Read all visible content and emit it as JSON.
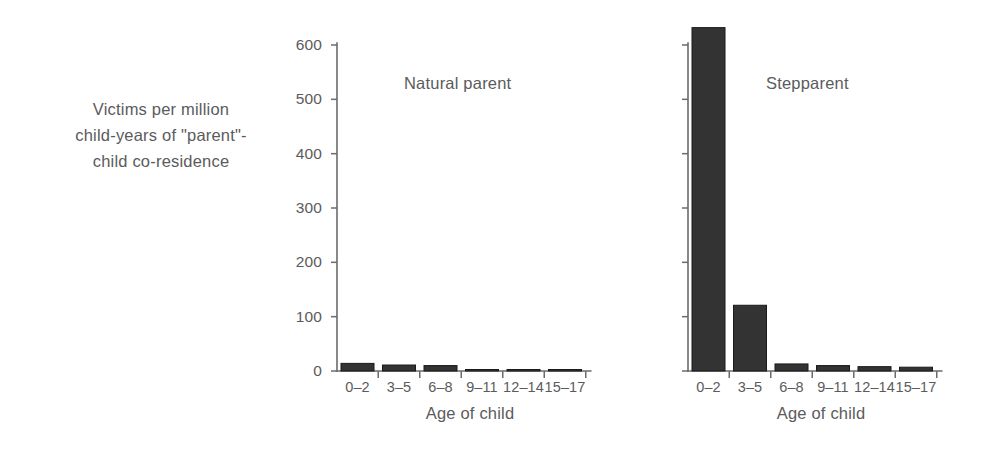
{
  "axis_caption": {
    "lines": [
      "Victims per million",
      "child-years of \"parent\"-",
      "child co-residence"
    ]
  },
  "colors": {
    "bar_fill": "#333333",
    "bar_edge": "#1a1a1a",
    "axis": "#6b6b6d",
    "text": "#5b5b5d",
    "background": "#ffffff"
  },
  "chart_data": {
    "type": "bar",
    "title": "",
    "subtitle": "",
    "xlabel": "Age of child",
    "ylabel": "Victims per million child-years of \"parent\"-child co-residence",
    "categories": [
      "0–2",
      "3–5",
      "6–8",
      "9–11",
      "12–14",
      "15–17"
    ],
    "ylim": [
      0,
      640
    ],
    "yticks": [
      0,
      100,
      200,
      300,
      400,
      500,
      600
    ],
    "ytick_labels": [
      "0",
      "100",
      "200",
      "300",
      "400",
      "500",
      "600"
    ],
    "grid": false,
    "legend_position": "none",
    "panels": [
      {
        "name": "natural-parent",
        "label": "Natural parent",
        "xlabel": "Age of child",
        "show_y_numbers": true,
        "values": [
          14,
          11,
          10,
          0.6,
          0.4,
          0.4
        ]
      },
      {
        "name": "stepparent",
        "label": "Stepparent",
        "xlabel": "Age of child",
        "show_y_numbers": false,
        "values": [
          632,
          121,
          13,
          10,
          8,
          7
        ]
      }
    ]
  }
}
